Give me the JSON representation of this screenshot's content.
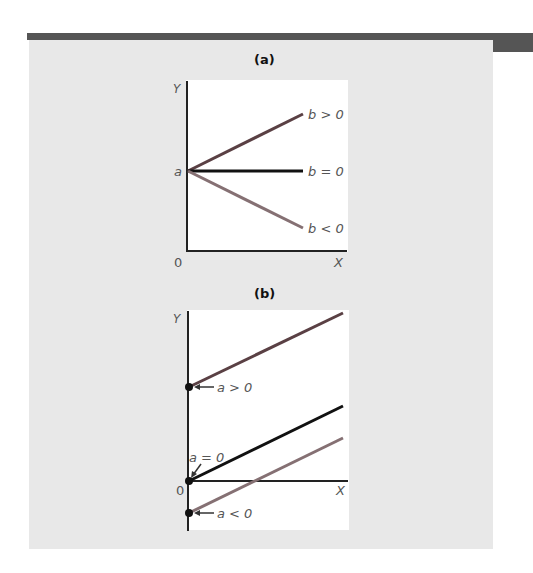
{
  "panel_a": {
    "title": "(a)",
    "y_axis_label": "Y",
    "x_axis_label": "X",
    "origin_label": "0",
    "intercept_label": "a",
    "lines": [
      {
        "label": "b > 0",
        "color": "#5a4044"
      },
      {
        "label": "b = 0",
        "color": "#111111"
      },
      {
        "label": "b < 0",
        "color": "#857073"
      }
    ]
  },
  "panel_b": {
    "title": "(b)",
    "y_axis_label": "Y",
    "x_axis_label": "X",
    "origin_label": "0",
    "intercepts": [
      {
        "label": "a > 0",
        "color": "#5a4044"
      },
      {
        "label": "a = 0",
        "color": "#111111"
      },
      {
        "label": "a < 0",
        "color": "#857073"
      }
    ]
  },
  "colors": {
    "frame_bar": "#555555",
    "panel_bg": "#e8e8e8",
    "plot_bg": "#ffffff",
    "axis": "#222222"
  }
}
